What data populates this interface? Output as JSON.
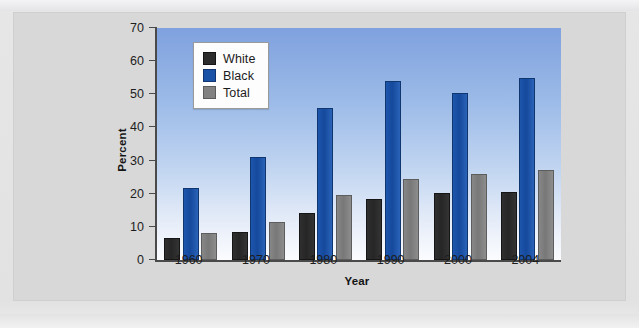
{
  "figure": {
    "background_color": "#d8d8d8",
    "page_color": "#e9e9e9"
  },
  "axes": {
    "y_title": "Percent",
    "x_title": "Year",
    "y_ticks": [
      "0",
      "10",
      "20",
      "30",
      "40",
      "50",
      "60",
      "70"
    ],
    "x_ticks": [
      "1960",
      "1970",
      "1980",
      "1990",
      "2000",
      "2004"
    ]
  },
  "legend": {
    "items": [
      {
        "label": "White",
        "color": "#2c2c2c",
        "key": "white"
      },
      {
        "label": "Black",
        "color": "#1a52a8",
        "key": "black"
      },
      {
        "label": "Total",
        "color": "#828282",
        "key": "total"
      }
    ]
  },
  "chart_data": {
    "type": "bar",
    "title": "",
    "xlabel": "Year",
    "ylabel": "Percent",
    "ylim": [
      0,
      70
    ],
    "ytick_step": 10,
    "grid": false,
    "legend_position": "top-left inside plot",
    "categories": [
      "1960",
      "1970",
      "1980",
      "1990",
      "2000",
      "2004"
    ],
    "series": [
      {
        "name": "White",
        "color": "#2c2c2c",
        "values": [
          6.7,
          8.5,
          14.3,
          18.5,
          20.3,
          20.6
        ]
      },
      {
        "name": "Black",
        "color": "#1a52a8",
        "values": [
          21.7,
          31.2,
          45.8,
          54.1,
          50.4,
          54.9
        ]
      },
      {
        "name": "Total",
        "color": "#828282",
        "values": [
          8.3,
          11.5,
          19.6,
          24.5,
          26.0,
          27.1
        ]
      }
    ]
  },
  "edge_text": {
    "top_fragment": "",
    "bottom_fragment": ""
  }
}
